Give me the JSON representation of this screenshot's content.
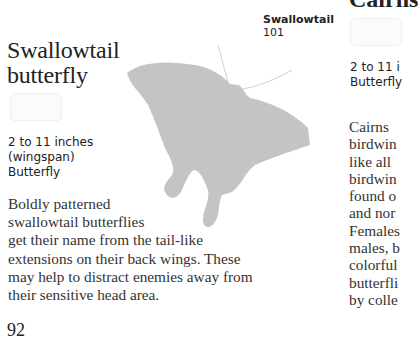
{
  "left_entry": {
    "title_line1": "Swallowtail",
    "title_line2": "butterfly",
    "stamp_text": "ৼ৳ᎼᏞ",
    "facts": {
      "size": "2 to 11 inches",
      "size_note": "(wingspan)",
      "type": "Butterfly"
    },
    "body": [
      "Boldly patterned",
      "swallowtail butterflies",
      "get their name from the tail-like",
      "extensions on their back wings. These",
      "may help to distract enemies away from",
      "their sensitive head area."
    ]
  },
  "silhouette_label": {
    "name": "Swallowtail",
    "number": "101"
  },
  "silhouette": {
    "icon": "butterfly-silhouette-icon",
    "color": "#c4c4c4"
  },
  "right_entry": {
    "title": "Cairns",
    "facts": {
      "size": "2 to 11 i",
      "type": "Butterfly"
    },
    "body": [
      "Cairns",
      "birdwin",
      "like all",
      "birdwin",
      "found o",
      "and nor",
      "Females",
      "males, b",
      "colorful",
      "butterfli",
      "by colle"
    ]
  },
  "page": {
    "number": "92"
  }
}
